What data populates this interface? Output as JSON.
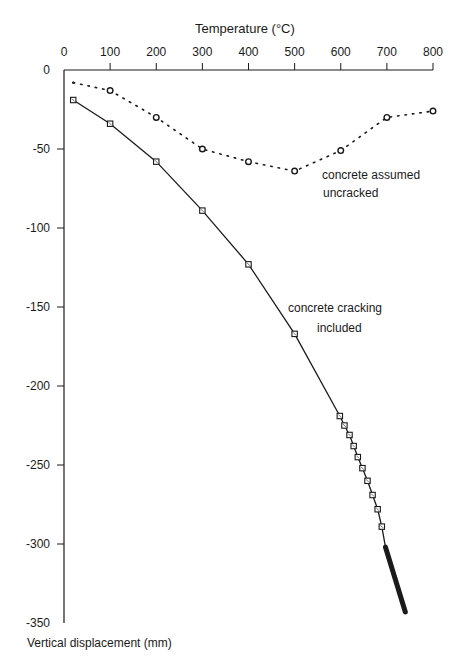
{
  "chart_data": {
    "type": "line",
    "title": "",
    "xlabel": "Temperature (°C)",
    "ylabel": "Vertical displacement (mm)",
    "xlim": [
      0,
      800
    ],
    "ylim": [
      -350,
      0
    ],
    "x_axis_position": "top",
    "grid": false,
    "x_ticks": [
      "0",
      "100",
      "200",
      "300",
      "400",
      "500",
      "600",
      "700",
      "800"
    ],
    "y_ticks": [
      "0",
      "-50",
      "-100",
      "-150",
      "-200",
      "-250",
      "-300",
      "-350"
    ],
    "series": [
      {
        "name": "concrete assumed uncracked",
        "style": "dotted",
        "marker": "circle",
        "x": [
          20,
          100,
          200,
          300,
          400,
          500,
          600,
          700,
          800
        ],
        "y": [
          -8,
          -13,
          -30,
          -50,
          -58,
          -64,
          -51,
          -30,
          -26
        ]
      },
      {
        "name": "concrete cracking included",
        "style": "solid",
        "marker": "square",
        "x": [
          20,
          100,
          200,
          300,
          400,
          500,
          598,
          608,
          619,
          628,
          637,
          647,
          658,
          669,
          680,
          689,
          697,
          740
        ],
        "y": [
          -19,
          -34,
          -58,
          -89,
          -123,
          -167,
          -219,
          -225,
          -231,
          -238,
          -245,
          -252,
          -260,
          -269,
          -278,
          -289,
          -302,
          -343
        ]
      }
    ],
    "annotations": [
      {
        "text": "concrete assumed",
        "x": 322,
        "y": 176
      },
      {
        "text": "uncracked",
        "x": 323,
        "y": 193
      },
      {
        "text": "concrete cracking",
        "x": 288,
        "y": 308
      },
      {
        "text": "included",
        "x": 317,
        "y": 328
      }
    ]
  },
  "labels": {
    "xlabel": "Temperature (°C)",
    "ylabel": "Vertical displacement (mm)",
    "annot_uncracked_1": "concrete assumed",
    "annot_uncracked_2": "uncracked",
    "annot_cracking_1": "concrete cracking",
    "annot_cracking_2": "included"
  },
  "colors": {
    "ink": "#1a1a1a",
    "background": "#ffffff"
  }
}
